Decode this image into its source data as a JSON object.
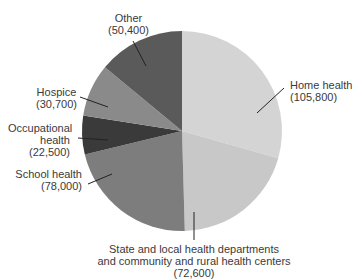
{
  "chart_data": {
    "type": "pie",
    "title": "",
    "start_angle_deg": 0,
    "direction": "clockwise",
    "slices": [
      {
        "label": "Home health",
        "value": 105800,
        "value_text": "(105,800)",
        "color": "#d4d4d4"
      },
      {
        "label": "State and local health departments and community and rural health centers",
        "value": 72600,
        "value_text": "(72,600)",
        "color": "#c8c8c8"
      },
      {
        "label": "School health",
        "value": 78000,
        "value_text": "(78,000)",
        "color": "#7d7d7d"
      },
      {
        "label": "Occupational health",
        "value": 22500,
        "value_text": "(22,500)",
        "color": "#3a3a3a"
      },
      {
        "label": "Hospice",
        "value": 30700,
        "value_text": "(30,700)",
        "color": "#8a8a8a"
      },
      {
        "label": "Other",
        "value": 50400,
        "value_text": "(50,400)",
        "color": "#5a5a5a"
      }
    ],
    "total": 360000,
    "legend": "none (callout labels)"
  },
  "labels": {
    "home": {
      "line1": "Home health",
      "line2": "(105,800)"
    },
    "state": {
      "line1": "State and local health departments",
      "line2": "and community and rural health centers",
      "line3": "(72,600)"
    },
    "school": {
      "line1": "School health",
      "line2": "(78,000)"
    },
    "occupational": {
      "line1": "Occupational",
      "line2": "health",
      "line3": "(22,500)"
    },
    "hospice": {
      "line1": "Hospice",
      "line2": "(30,700)"
    },
    "other": {
      "line1": "Other",
      "line2": "(50,400)"
    }
  }
}
